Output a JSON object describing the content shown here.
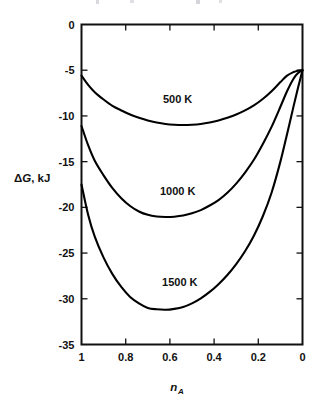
{
  "figure": {
    "background_color": "#ffffff",
    "line_color": "#000000"
  },
  "chart_data": {
    "type": "line",
    "title": "",
    "subtitle": "",
    "xlabel": "n_A",
    "xlabel_base": "n",
    "xlabel_sub": "A",
    "ylabel": "ΔG, kJ",
    "ylabel_delta": "Δ",
    "ylabel_g": "G",
    "ylabel_rest": ", kJ",
    "xlim": [
      1,
      0
    ],
    "ylim": [
      -35,
      0
    ],
    "x_reversed": true,
    "grid": false,
    "legend": "inline-curve-labels",
    "xticks": [
      1,
      0.8,
      0.6,
      0.4,
      0.2,
      0
    ],
    "xticklabels": [
      "1",
      "0.8",
      "0.6",
      "0.4",
      "0.2",
      "0"
    ],
    "yticks": [
      0,
      -5,
      -10,
      -15,
      -20,
      -25,
      -30,
      -35
    ],
    "yticklabels": [
      "0",
      "-5",
      "-10",
      "-15",
      "-20",
      "-25",
      "-30",
      "-35"
    ],
    "series": [
      {
        "name": "500 K",
        "label": "500 K",
        "label_x": 0.565,
        "label_y": -8.6,
        "minimum": {
          "x": 0.55,
          "y": -11.0
        },
        "endpoints": {
          "left_y": -5.6,
          "right_y": -5.0
        },
        "x": [
          1.0,
          0.97,
          0.94,
          0.9,
          0.86,
          0.82,
          0.78,
          0.74,
          0.7,
          0.66,
          0.62,
          0.58,
          0.54,
          0.5,
          0.46,
          0.42,
          0.38,
          0.34,
          0.3,
          0.26,
          0.22,
          0.18,
          0.14,
          0.1,
          0.07,
          0.04,
          0.02,
          0.0
        ],
        "y": [
          -5.6,
          -6.6,
          -7.4,
          -8.2,
          -8.9,
          -9.4,
          -9.85,
          -10.2,
          -10.5,
          -10.72,
          -10.88,
          -10.97,
          -11.0,
          -10.97,
          -10.88,
          -10.72,
          -10.5,
          -10.2,
          -9.85,
          -9.4,
          -8.85,
          -8.15,
          -7.3,
          -6.3,
          -5.6,
          -5.2,
          -5.05,
          -5.0
        ]
      },
      {
        "name": "1000 K",
        "label": "1000 K",
        "label_x": 0.565,
        "label_y": -18.6,
        "minimum": {
          "x": 0.55,
          "y": -21.0
        },
        "endpoints": {
          "left_y": -11.1,
          "right_y": -5.0
        },
        "x": [
          1.0,
          0.97,
          0.94,
          0.9,
          0.86,
          0.82,
          0.78,
          0.74,
          0.7,
          0.66,
          0.62,
          0.58,
          0.54,
          0.5,
          0.46,
          0.42,
          0.38,
          0.34,
          0.3,
          0.26,
          0.22,
          0.18,
          0.14,
          0.1,
          0.07,
          0.04,
          0.02,
          0.0
        ],
        "y": [
          -11.1,
          -13.2,
          -14.9,
          -16.5,
          -17.9,
          -19.0,
          -19.85,
          -20.45,
          -20.82,
          -21.0,
          -21.05,
          -21.02,
          -20.9,
          -20.65,
          -20.3,
          -19.8,
          -19.2,
          -18.4,
          -17.4,
          -16.2,
          -14.8,
          -13.1,
          -11.2,
          -9.0,
          -7.3,
          -5.9,
          -5.3,
          -5.0
        ]
      },
      {
        "name": "1500 K",
        "label": "1500 K",
        "label_x": 0.555,
        "label_y": -28.6,
        "minimum": {
          "x": 0.62,
          "y": -31.2
        },
        "endpoints": {
          "left_y": -17.5,
          "right_y": -5.0
        },
        "x": [
          1.0,
          0.97,
          0.94,
          0.9,
          0.86,
          0.82,
          0.78,
          0.74,
          0.7,
          0.66,
          0.62,
          0.58,
          0.54,
          0.5,
          0.46,
          0.42,
          0.38,
          0.34,
          0.3,
          0.26,
          0.22,
          0.18,
          0.14,
          0.1,
          0.07,
          0.04,
          0.02,
          0.0
        ],
        "y": [
          -17.5,
          -20.8,
          -23.2,
          -25.5,
          -27.3,
          -28.7,
          -29.8,
          -30.5,
          -31.0,
          -31.15,
          -31.2,
          -31.1,
          -30.9,
          -30.5,
          -29.95,
          -29.25,
          -28.4,
          -27.4,
          -26.2,
          -24.8,
          -23.1,
          -21.0,
          -18.4,
          -15.0,
          -12.0,
          -8.9,
          -6.9,
          -5.0
        ]
      }
    ]
  }
}
